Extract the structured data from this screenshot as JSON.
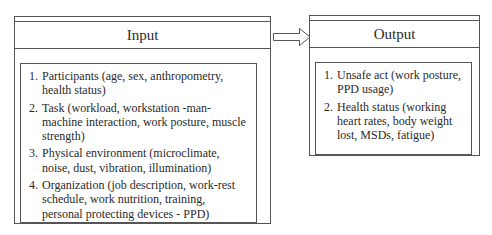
{
  "input": {
    "title": "Input",
    "items": [
      {
        "num": "1.",
        "text": "Participants (age, sex, anthropometry, health status)"
      },
      {
        "num": "2.",
        "text": "Task (workload, workstation -man-machine interaction, work posture, muscle strength)"
      },
      {
        "num": "3.",
        "text": "Physical environment (microclimate, noise, dust, vibration, illumination)"
      },
      {
        "num": "4.",
        "text": "Organization (job description, work-rest schedule, work nutrition, training, personal protecting devices - PPD)"
      }
    ]
  },
  "arrow": {
    "icon": "right-arrow-icon",
    "direction": "input-to-output"
  },
  "output": {
    "title": "Output",
    "items": [
      {
        "num": "1.",
        "text": "Unsafe act (work posture, PPD usage)"
      },
      {
        "num": "2.",
        "text": "Health status (working heart rates, body weight lost, MSDs, fatigue)"
      }
    ]
  }
}
